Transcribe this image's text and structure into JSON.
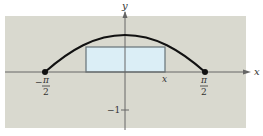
{
  "figure": {
    "background_color": "#d9d9cf",
    "rect_fill": "#dbeef6",
    "curve": "y = cos(x)",
    "axes": {
      "x_label": "x",
      "y_label": "y"
    },
    "tick_labels": {
      "left": {
        "sign": "−",
        "numerator": "π",
        "denominator": "2"
      },
      "right": {
        "numerator": "π",
        "denominator": "2"
      },
      "rect_corner_x": "x",
      "y_minus_one": "−1"
    }
  }
}
